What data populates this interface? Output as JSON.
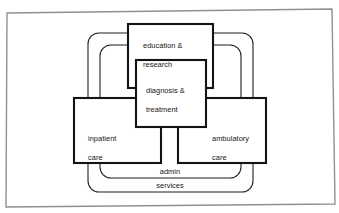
{
  "diagram": {
    "background_color": "#ffffff",
    "line_color": "#1a1a1a",
    "frame_color": "#8c8c8c",
    "boxes": [
      {
        "id": "education-research",
        "label": "education &\nresearch",
        "line1": "education &",
        "line2": "research",
        "x": 128,
        "y": 24,
        "w": 85,
        "h": 64
      },
      {
        "id": "diagnosis-treatment",
        "label": "diagnosis &\ntreatment",
        "line1": "diagnosis &",
        "line2": "treatment",
        "x": 136,
        "y": 60,
        "w": 70,
        "h": 67
      },
      {
        "id": "inpatient-care",
        "label": "inpatient\ncare",
        "line1": "inpatient",
        "line2": "care",
        "x": 74,
        "y": 98,
        "w": 87,
        "h": 65
      },
      {
        "id": "ambulatory-care",
        "label": "ambulatory\ncare",
        "line1": "ambulatory",
        "line2": "care",
        "x": 178,
        "y": 98,
        "w": 88,
        "h": 65
      }
    ],
    "loops": [
      {
        "id": "outer-loop",
        "x": 88,
        "y": 33,
        "w": 165,
        "h": 159,
        "radius": 11
      },
      {
        "id": "inner-loop",
        "x": 100,
        "y": 45,
        "w": 141,
        "h": 133,
        "radius": 11
      }
    ],
    "loop_labels": [
      {
        "id": "admin-label",
        "text": "admin",
        "x": 170,
        "y": 172
      },
      {
        "id": "services-label",
        "text": "services",
        "x": 170,
        "y": 186
      }
    ]
  }
}
